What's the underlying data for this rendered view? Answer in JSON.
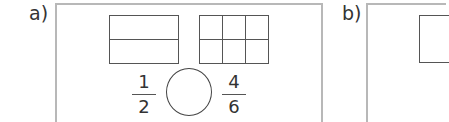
{
  "panels": [
    {
      "label": "a)",
      "shapes": [
        {
          "type": "rectangle",
          "rows": 2,
          "cols": 1
        },
        {
          "type": "rectangle",
          "rows": 2,
          "cols": 3
        }
      ],
      "comparison": {
        "left": {
          "numerator": "1",
          "denominator": "2"
        },
        "symbol_blank": "",
        "right": {
          "numerator": "4",
          "denominator": "6"
        }
      }
    },
    {
      "label": "b)",
      "shapes": [
        {
          "type": "rectangle"
        }
      ]
    }
  ]
}
